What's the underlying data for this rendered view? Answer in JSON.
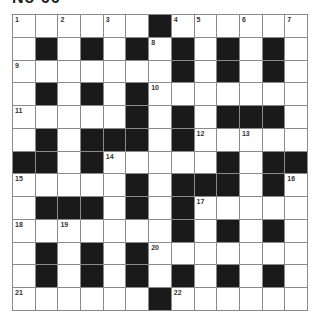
{
  "puzzle": {
    "title": "No 66",
    "rows": 13,
    "cols": 13,
    "grid": [
      "WWWWWWBWWWWWW",
      "WBWBWBWBWBWBW",
      "WWWWWWWBWBWBW",
      "WBWBWBWWWWWWW",
      "WWWWWBWBWBBBW",
      "WBWBBBWBWWWWW",
      "BBWBWWWWWBWBB",
      "WWWWWBWBBBWBW",
      "WBBBWBWBWWWWW",
      "WWWWWWWBWBWBW",
      "WBWBWBWWWWWWW",
      "WBWBWBWBWBWBW",
      "WWWWWWBWWWWWW"
    ],
    "numbers": [
      {
        "r": 0,
        "c": 0,
        "n": "1"
      },
      {
        "r": 0,
        "c": 2,
        "n": "2"
      },
      {
        "r": 0,
        "c": 4,
        "n": "3"
      },
      {
        "r": 0,
        "c": 7,
        "n": "4"
      },
      {
        "r": 0,
        "c": 8,
        "n": "5"
      },
      {
        "r": 0,
        "c": 10,
        "n": "6"
      },
      {
        "r": 0,
        "c": 12,
        "n": "7"
      },
      {
        "r": 1,
        "c": 6,
        "n": "8"
      },
      {
        "r": 2,
        "c": 0,
        "n": "9"
      },
      {
        "r": 3,
        "c": 6,
        "n": "10"
      },
      {
        "r": 4,
        "c": 0,
        "n": "11"
      },
      {
        "r": 5,
        "c": 8,
        "n": "12"
      },
      {
        "r": 5,
        "c": 10,
        "n": "13"
      },
      {
        "r": 6,
        "c": 4,
        "n": "14"
      },
      {
        "r": 7,
        "c": 0,
        "n": "15"
      },
      {
        "r": 7,
        "c": 12,
        "n": "16"
      },
      {
        "r": 8,
        "c": 8,
        "n": "17"
      },
      {
        "r": 9,
        "c": 0,
        "n": "18"
      },
      {
        "r": 9,
        "c": 2,
        "n": "19"
      },
      {
        "r": 10,
        "c": 6,
        "n": "20"
      },
      {
        "r": 12,
        "c": 0,
        "n": "21"
      },
      {
        "r": 12,
        "c": 7,
        "n": "22"
      }
    ],
    "colors": {
      "black_cell": "#1a1a1a",
      "white_cell": "#ffffff",
      "grid_line": "#8a8a8a"
    }
  }
}
